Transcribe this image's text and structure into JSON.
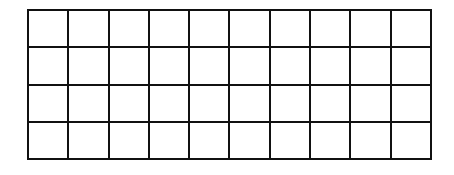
{
  "grid": {
    "rows": 4,
    "columns": 10,
    "line_color": "#111111",
    "fill_color": "#ffffff",
    "cells": [
      [
        "",
        "",
        "",
        "",
        "",
        "",
        "",
        "",
        "",
        ""
      ],
      [
        "",
        "",
        "",
        "",
        "",
        "",
        "",
        "",
        "",
        ""
      ],
      [
        "",
        "",
        "",
        "",
        "",
        "",
        "",
        "",
        "",
        ""
      ],
      [
        "",
        "",
        "",
        "",
        "",
        "",
        "",
        "",
        "",
        ""
      ]
    ]
  }
}
